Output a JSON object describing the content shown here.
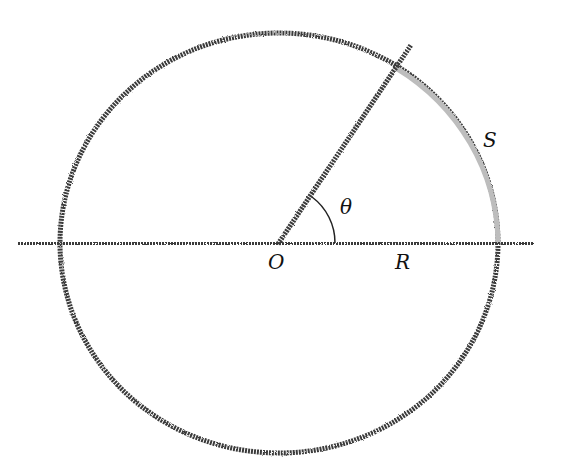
{
  "diagram": {
    "labels": {
      "origin": "O",
      "radius": "R",
      "angle": "θ",
      "arc": "S"
    },
    "colors": {
      "stroke": "#3a3a3a",
      "arc_highlight": "#bdbdbd",
      "text": "#111111",
      "background": "#ffffff"
    },
    "geometry": {
      "center": [
        279,
        243
      ],
      "rx": 219,
      "ry": 210,
      "horizontal_line": [
        18,
        534
      ],
      "radial_line_end": [
        411,
        45
      ],
      "arc_start": [
        396,
        68
      ],
      "arc_end": [
        498,
        243
      ]
    }
  }
}
